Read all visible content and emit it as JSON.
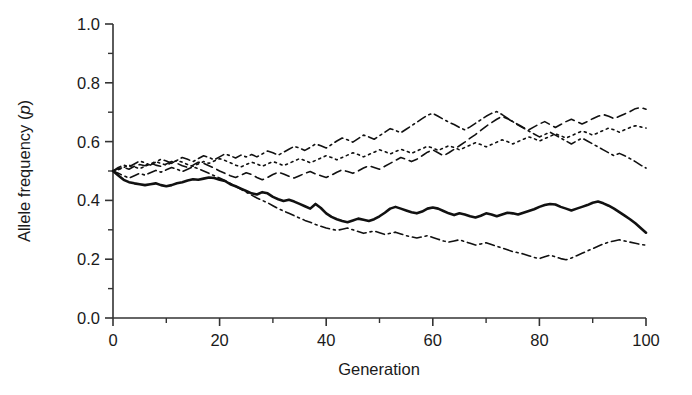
{
  "chart_data": {
    "type": "line",
    "title": "",
    "xlabel": "Generation",
    "ylabel": "Allele frequency (p)",
    "ylabel_plain": "Allele frequency (",
    "ylabel_italic": "p",
    "ylabel_close": ")",
    "xlim": [
      0,
      100
    ],
    "ylim": [
      0.0,
      1.0
    ],
    "grid": false,
    "legend": "none",
    "x_ticks": [
      0,
      20,
      40,
      60,
      80,
      100
    ],
    "x_tick_labels": [
      "0",
      "20",
      "40",
      "60",
      "80",
      "100"
    ],
    "x_minor_ticks": [
      10,
      30,
      50,
      70,
      90
    ],
    "y_ticks": [
      0.0,
      0.2,
      0.4,
      0.6,
      0.8,
      1.0
    ],
    "y_tick_labels": [
      "0.0",
      "0.2",
      "0.4",
      "0.6",
      "0.8",
      "1.0"
    ],
    "y_minor_ticks": [
      0.1,
      0.3,
      0.5,
      0.7,
      0.9
    ],
    "x": [
      0,
      1,
      2,
      3,
      4,
      5,
      6,
      7,
      8,
      9,
      10,
      11,
      12,
      13,
      14,
      15,
      16,
      17,
      18,
      19,
      20,
      21,
      22,
      23,
      24,
      25,
      26,
      27,
      28,
      29,
      30,
      31,
      32,
      33,
      34,
      35,
      36,
      37,
      38,
      39,
      40,
      41,
      42,
      43,
      44,
      45,
      46,
      47,
      48,
      49,
      50,
      51,
      52,
      53,
      54,
      55,
      56,
      57,
      58,
      59,
      60,
      61,
      62,
      63,
      64,
      65,
      66,
      67,
      68,
      69,
      70,
      71,
      72,
      73,
      74,
      75,
      76,
      77,
      78,
      79,
      80,
      81,
      82,
      83,
      84,
      85,
      86,
      87,
      88,
      89,
      90,
      91,
      92,
      93,
      94,
      95,
      96,
      97,
      98,
      99,
      100
    ],
    "series": [
      {
        "name": "population-1-solid",
        "style": "solid",
        "linewidth": 2.6,
        "color": "#111111",
        "start_value": 0.5,
        "end_value": 0.29,
        "values": [
          0.5,
          0.485,
          0.47,
          0.462,
          0.458,
          0.455,
          0.452,
          0.455,
          0.458,
          0.452,
          0.448,
          0.452,
          0.458,
          0.462,
          0.468,
          0.472,
          0.47,
          0.474,
          0.478,
          0.476,
          0.47,
          0.466,
          0.455,
          0.448,
          0.44,
          0.432,
          0.424,
          0.42,
          0.428,
          0.424,
          0.412,
          0.404,
          0.398,
          0.402,
          0.396,
          0.388,
          0.38,
          0.372,
          0.388,
          0.374,
          0.356,
          0.344,
          0.336,
          0.33,
          0.326,
          0.332,
          0.338,
          0.334,
          0.33,
          0.336,
          0.346,
          0.358,
          0.372,
          0.378,
          0.372,
          0.366,
          0.36,
          0.356,
          0.362,
          0.372,
          0.376,
          0.372,
          0.364,
          0.356,
          0.35,
          0.356,
          0.352,
          0.346,
          0.342,
          0.348,
          0.356,
          0.352,
          0.346,
          0.352,
          0.358,
          0.356,
          0.352,
          0.358,
          0.364,
          0.37,
          0.378,
          0.384,
          0.388,
          0.386,
          0.378,
          0.372,
          0.366,
          0.372,
          0.378,
          0.384,
          0.392,
          0.396,
          0.39,
          0.382,
          0.372,
          0.36,
          0.348,
          0.336,
          0.322,
          0.306,
          0.29
        ]
      },
      {
        "name": "population-2-dashed",
        "style": "dashed",
        "linewidth": 1.6,
        "color": "#111111",
        "start_value": 0.5,
        "end_value": 0.71,
        "values": [
          0.5,
          0.508,
          0.512,
          0.506,
          0.516,
          0.522,
          0.518,
          0.528,
          0.52,
          0.516,
          0.524,
          0.532,
          0.526,
          0.518,
          0.512,
          0.52,
          0.53,
          0.526,
          0.518,
          0.51,
          0.5,
          0.492,
          0.484,
          0.478,
          0.486,
          0.494,
          0.488,
          0.478,
          0.47,
          0.478,
          0.488,
          0.496,
          0.49,
          0.482,
          0.476,
          0.484,
          0.492,
          0.498,
          0.49,
          0.484,
          0.478,
          0.486,
          0.496,
          0.504,
          0.498,
          0.492,
          0.5,
          0.51,
          0.518,
          0.512,
          0.506,
          0.516,
          0.526,
          0.536,
          0.546,
          0.54,
          0.532,
          0.54,
          0.552,
          0.564,
          0.572,
          0.562,
          0.552,
          0.562,
          0.574,
          0.586,
          0.598,
          0.612,
          0.624,
          0.638,
          0.652,
          0.664,
          0.676,
          0.686,
          0.678,
          0.668,
          0.658,
          0.648,
          0.64,
          0.65,
          0.66,
          0.668,
          0.658,
          0.648,
          0.658,
          0.668,
          0.676,
          0.668,
          0.66,
          0.668,
          0.678,
          0.686,
          0.692,
          0.686,
          0.678,
          0.686,
          0.694,
          0.702,
          0.712,
          0.716,
          0.71
        ]
      },
      {
        "name": "population-3-dotted",
        "style": "dotted",
        "linewidth": 1.6,
        "color": "#111111",
        "start_value": 0.5,
        "end_value": 0.65,
        "values": [
          0.5,
          0.504,
          0.512,
          0.52,
          0.514,
          0.508,
          0.516,
          0.524,
          0.532,
          0.526,
          0.52,
          0.528,
          0.536,
          0.53,
          0.522,
          0.516,
          0.524,
          0.532,
          0.526,
          0.534,
          0.542,
          0.536,
          0.528,
          0.52,
          0.514,
          0.522,
          0.53,
          0.524,
          0.516,
          0.524,
          0.532,
          0.526,
          0.518,
          0.526,
          0.534,
          0.542,
          0.536,
          0.528,
          0.536,
          0.544,
          0.552,
          0.546,
          0.538,
          0.546,
          0.554,
          0.562,
          0.556,
          0.548,
          0.556,
          0.564,
          0.572,
          0.566,
          0.558,
          0.566,
          0.574,
          0.568,
          0.56,
          0.568,
          0.576,
          0.584,
          0.578,
          0.57,
          0.578,
          0.586,
          0.58,
          0.572,
          0.58,
          0.588,
          0.596,
          0.59,
          0.582,
          0.59,
          0.598,
          0.606,
          0.6,
          0.592,
          0.6,
          0.608,
          0.616,
          0.61,
          0.602,
          0.61,
          0.618,
          0.626,
          0.62,
          0.612,
          0.62,
          0.628,
          0.636,
          0.63,
          0.622,
          0.63,
          0.638,
          0.646,
          0.64,
          0.632,
          0.64,
          0.648,
          0.654,
          0.65,
          0.646
        ]
      },
      {
        "name": "population-4-dashdot-upper",
        "style": "dashdot",
        "linewidth": 1.6,
        "color": "#111111",
        "start_value": 0.5,
        "end_value": 0.51,
        "values": [
          0.5,
          0.512,
          0.52,
          0.514,
          0.524,
          0.534,
          0.528,
          0.52,
          0.53,
          0.54,
          0.534,
          0.526,
          0.536,
          0.546,
          0.54,
          0.532,
          0.542,
          0.552,
          0.546,
          0.538,
          0.548,
          0.558,
          0.552,
          0.544,
          0.554,
          0.548,
          0.556,
          0.548,
          0.558,
          0.568,
          0.562,
          0.554,
          0.564,
          0.574,
          0.584,
          0.578,
          0.57,
          0.58,
          0.592,
          0.586,
          0.578,
          0.59,
          0.602,
          0.612,
          0.606,
          0.598,
          0.61,
          0.622,
          0.616,
          0.608,
          0.62,
          0.632,
          0.644,
          0.638,
          0.63,
          0.642,
          0.654,
          0.666,
          0.678,
          0.69,
          0.696,
          0.686,
          0.676,
          0.666,
          0.658,
          0.648,
          0.64,
          0.65,
          0.662,
          0.674,
          0.686,
          0.696,
          0.702,
          0.692,
          0.68,
          0.668,
          0.656,
          0.646,
          0.636,
          0.626,
          0.616,
          0.624,
          0.632,
          0.622,
          0.612,
          0.602,
          0.592,
          0.602,
          0.612,
          0.602,
          0.592,
          0.582,
          0.572,
          0.562,
          0.552,
          0.56,
          0.552,
          0.542,
          0.532,
          0.52,
          0.51
        ]
      },
      {
        "name": "population-5-dashdot-lower",
        "style": "dashdot",
        "linewidth": 1.6,
        "color": "#111111",
        "start_value": 0.5,
        "end_value": 0.25,
        "values": [
          0.5,
          0.492,
          0.484,
          0.476,
          0.484,
          0.492,
          0.486,
          0.494,
          0.502,
          0.496,
          0.504,
          0.512,
          0.506,
          0.498,
          0.506,
          0.514,
          0.508,
          0.5,
          0.492,
          0.484,
          0.476,
          0.468,
          0.458,
          0.448,
          0.438,
          0.428,
          0.418,
          0.408,
          0.4,
          0.392,
          0.382,
          0.372,
          0.364,
          0.356,
          0.348,
          0.34,
          0.332,
          0.326,
          0.318,
          0.312,
          0.306,
          0.302,
          0.298,
          0.302,
          0.306,
          0.3,
          0.294,
          0.288,
          0.292,
          0.296,
          0.29,
          0.284,
          0.288,
          0.292,
          0.286,
          0.28,
          0.276,
          0.272,
          0.276,
          0.28,
          0.274,
          0.268,
          0.262,
          0.258,
          0.262,
          0.266,
          0.26,
          0.254,
          0.248,
          0.252,
          0.256,
          0.25,
          0.244,
          0.238,
          0.232,
          0.226,
          0.222,
          0.218,
          0.212,
          0.206,
          0.202,
          0.208,
          0.214,
          0.208,
          0.202,
          0.198,
          0.204,
          0.212,
          0.22,
          0.228,
          0.236,
          0.244,
          0.252,
          0.258,
          0.262,
          0.266,
          0.262,
          0.258,
          0.254,
          0.25,
          0.248
        ]
      }
    ]
  },
  "axes": {
    "x_title": "Generation",
    "y_title_prefix": "Allele frequency (",
    "y_title_italic": "p",
    "y_title_suffix": ")"
  }
}
